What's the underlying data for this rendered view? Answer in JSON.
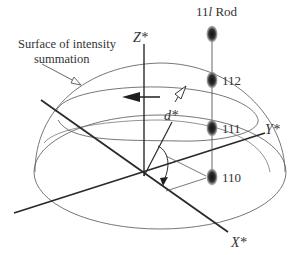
{
  "diagram": {
    "caption_lines": [
      "Surface of intensity",
      "summation"
    ],
    "axes": {
      "z": "Z*",
      "y": "Y*",
      "x": "X*"
    },
    "vector_label": "d*",
    "rod_label_prefix": "11",
    "rod_label_italic": "l",
    "rod_label_suffix": " Rod",
    "reflections": [
      "112",
      "111",
      "110"
    ],
    "colors": {
      "line": "#555555",
      "axis": "#2a2a2a",
      "spot": "#1e1e1e",
      "text": "#333333",
      "background": "#ffffff"
    }
  }
}
